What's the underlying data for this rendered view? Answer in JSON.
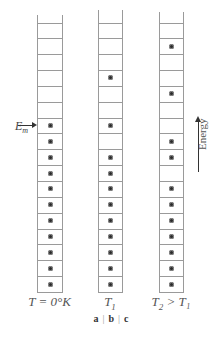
{
  "figure": {
    "caption_parts": [
      "a",
      "b",
      "c"
    ],
    "fermi_label": "E",
    "fermi_sub": "m",
    "axis_label": "Energy",
    "colors": {
      "line": "#9a9a9a",
      "dot": "#2a2a2a",
      "text": "#555555"
    }
  },
  "columns": [
    {
      "id": "a",
      "label_main": "T = 0°K",
      "label_sub": "",
      "label_rest": "",
      "x": 37,
      "width": 25,
      "top": 15,
      "occupied": [
        0,
        0,
        0,
        0,
        0,
        0,
        1,
        1,
        1,
        1,
        1,
        1,
        1,
        1,
        1,
        1,
        1
      ]
    },
    {
      "id": "b",
      "label_main": "T",
      "label_sub": "1",
      "label_rest": "",
      "x": 98,
      "width": 24,
      "top": 10,
      "occupied": [
        0,
        0,
        0,
        1,
        0,
        0,
        1,
        0,
        1,
        1,
        1,
        1,
        1,
        1,
        1,
        1,
        1
      ]
    },
    {
      "id": "c",
      "label_main": "T",
      "label_sub": "2",
      "label_rest": " > T₁",
      "x": 159,
      "width": 24,
      "top": 12,
      "occupied": [
        0,
        1,
        0,
        0,
        1,
        0,
        0,
        1,
        1,
        0,
        1,
        1,
        1,
        1,
        1,
        1,
        1
      ]
    }
  ],
  "chart_data": {
    "type": "table",
    "panels": [
      {
        "panel": "a",
        "temperature": "T = 0°K",
        "levels_bottom_to_top": [
          1,
          1,
          1,
          1,
          1,
          1,
          1,
          1,
          1,
          1,
          1,
          0,
          0,
          0,
          0,
          0,
          0
        ],
        "electrons": 11
      },
      {
        "panel": "b",
        "temperature": "T1",
        "levels_bottom_to_top": [
          1,
          1,
          1,
          1,
          1,
          1,
          1,
          1,
          1,
          0,
          1,
          0,
          0,
          1,
          0,
          0,
          0
        ],
        "electrons": 11
      },
      {
        "panel": "c",
        "temperature": "T2 > T1",
        "levels_bottom_to_top": [
          1,
          1,
          1,
          1,
          1,
          1,
          1,
          0,
          1,
          1,
          0,
          0,
          1,
          0,
          0,
          1,
          0
        ],
        "electrons": 11
      }
    ],
    "annotations": [
      "E_m (Fermi level arrow at top occupied level of panel a)",
      "Energy (upward arrow)"
    ]
  }
}
